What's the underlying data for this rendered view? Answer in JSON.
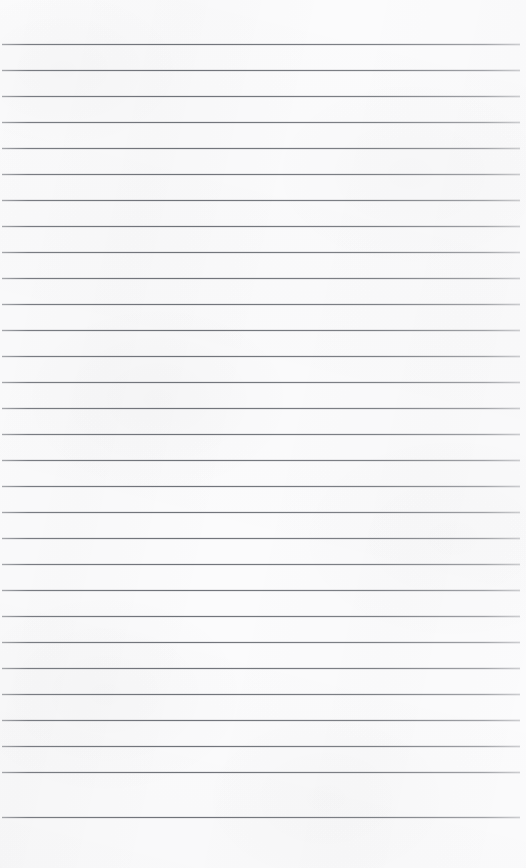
{
  "document": {
    "kind": "scanned-lined-paper",
    "title": "Blank Ruled Notebook Page",
    "description": "A scanned blank sheet of ruled (lined) writing paper. No handwriting, printed text, headings, page numbers or margin rule are present.",
    "orientation": "portrait",
    "page_width_px": 526,
    "page_height_px": 868,
    "paper_color": "#fbfbfc",
    "rule_color": "#6e7278",
    "has_vertical_margin_rule": false,
    "has_holes": false,
    "has_text_content": false,
    "written_content": "",
    "ruling": {
      "line_count": 30,
      "first_line_y_px": 44,
      "line_spacing_px": 26,
      "line_thickness_px": 1,
      "line_start_x_px": 2,
      "line_end_x_px": 520,
      "top_margin_px": 44,
      "bottom_margin_px": 51
    },
    "lines": [
      {
        "index": 1,
        "y": 44,
        "text": ""
      },
      {
        "index": 2,
        "y": 70,
        "text": ""
      },
      {
        "index": 3,
        "y": 96,
        "text": ""
      },
      {
        "index": 4,
        "y": 122,
        "text": ""
      },
      {
        "index": 5,
        "y": 148,
        "text": ""
      },
      {
        "index": 6,
        "y": 174,
        "text": ""
      },
      {
        "index": 7,
        "y": 200,
        "text": ""
      },
      {
        "index": 8,
        "y": 226,
        "text": ""
      },
      {
        "index": 9,
        "y": 252,
        "text": ""
      },
      {
        "index": 10,
        "y": 278,
        "text": ""
      },
      {
        "index": 11,
        "y": 304,
        "text": ""
      },
      {
        "index": 12,
        "y": 330,
        "text": ""
      },
      {
        "index": 13,
        "y": 356,
        "text": ""
      },
      {
        "index": 14,
        "y": 382,
        "text": ""
      },
      {
        "index": 15,
        "y": 408,
        "text": ""
      },
      {
        "index": 16,
        "y": 434,
        "text": ""
      },
      {
        "index": 17,
        "y": 460,
        "text": ""
      },
      {
        "index": 18,
        "y": 486,
        "text": ""
      },
      {
        "index": 19,
        "y": 512,
        "text": ""
      },
      {
        "index": 20,
        "y": 538,
        "text": ""
      },
      {
        "index": 21,
        "y": 564,
        "text": ""
      },
      {
        "index": 22,
        "y": 590,
        "text": ""
      },
      {
        "index": 23,
        "y": 616,
        "text": ""
      },
      {
        "index": 24,
        "y": 642,
        "text": ""
      },
      {
        "index": 25,
        "y": 668,
        "text": ""
      },
      {
        "index": 26,
        "y": 694,
        "text": ""
      },
      {
        "index": 27,
        "y": 720,
        "text": ""
      },
      {
        "index": 28,
        "y": 746,
        "text": ""
      },
      {
        "index": 29,
        "y": 772,
        "text": ""
      },
      {
        "index": 30,
        "y": 817,
        "text": ""
      }
    ]
  }
}
